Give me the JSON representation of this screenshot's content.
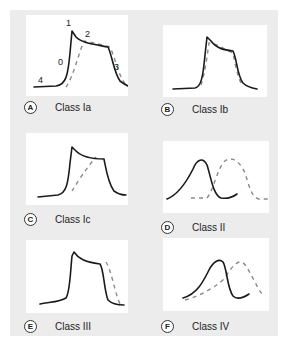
{
  "panels": [
    {
      "letter": "A",
      "label": "Class Ia",
      "phases": [
        "0",
        "1",
        "2",
        "3",
        "4"
      ]
    },
    {
      "letter": "B",
      "label": "Class Ib"
    },
    {
      "letter": "C",
      "label": "Class Ic"
    },
    {
      "letter": "D",
      "label": "Class II"
    },
    {
      "letter": "E",
      "label": "Class III"
    },
    {
      "letter": "F",
      "label": "Class IV"
    }
  ],
  "colors": {
    "panel_bg": "#ececec",
    "plot_bg": "#ffffff",
    "solid_line": "#1a1a1a",
    "dashed_line": "#8a8a8a"
  }
}
